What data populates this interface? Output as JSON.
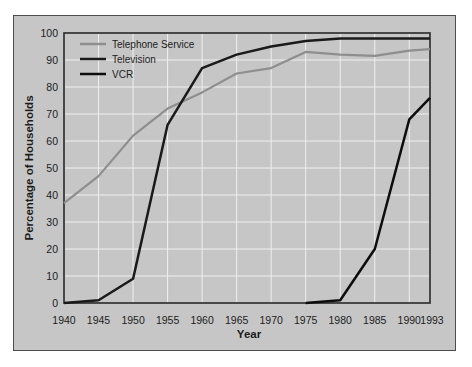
{
  "colors": {
    "page_bg": "#ffffff",
    "panel_bg": "#c6c6c6",
    "panel_border": "#4d4d4d",
    "grid": "#efefef",
    "frame": "#2e2e2e",
    "text": "#1c1c1c"
  },
  "chart_data": {
    "type": "line",
    "title": "",
    "xlabel": "Year",
    "ylabel": "Percentage of Households",
    "xlim": [
      1940,
      1993
    ],
    "ylim": [
      0,
      100
    ],
    "x_ticks": [
      1940,
      1945,
      1950,
      1955,
      1960,
      1965,
      1970,
      1975,
      1980,
      1985,
      1990,
      1993
    ],
    "y_ticks": [
      0,
      10,
      20,
      30,
      40,
      50,
      60,
      70,
      80,
      90,
      100
    ],
    "grid": true,
    "legend_position": "top-left",
    "series": [
      {
        "name": "Telephone Service",
        "color": "#8e8e8e",
        "x": [
          1940,
          1945,
          1950,
          1955,
          1960,
          1965,
          1970,
          1975,
          1980,
          1985,
          1990,
          1993
        ],
        "y": [
          37,
          47,
          62,
          72,
          78,
          85,
          87,
          93,
          92,
          91.5,
          93.5,
          94
        ]
      },
      {
        "name": "Television",
        "color": "#1a1a1a",
        "x": [
          1940,
          1945,
          1950,
          1955,
          1960,
          1965,
          1970,
          1975,
          1980,
          1985,
          1990,
          1993
        ],
        "y": [
          0,
          1,
          9,
          66,
          87,
          92,
          95,
          97,
          98,
          98,
          98,
          98
        ]
      },
      {
        "name": "VCR",
        "color": "#0d0d0d",
        "x": [
          1975,
          1980,
          1985,
          1990,
          1993
        ],
        "y": [
          0,
          1,
          20,
          68,
          76
        ]
      }
    ]
  }
}
